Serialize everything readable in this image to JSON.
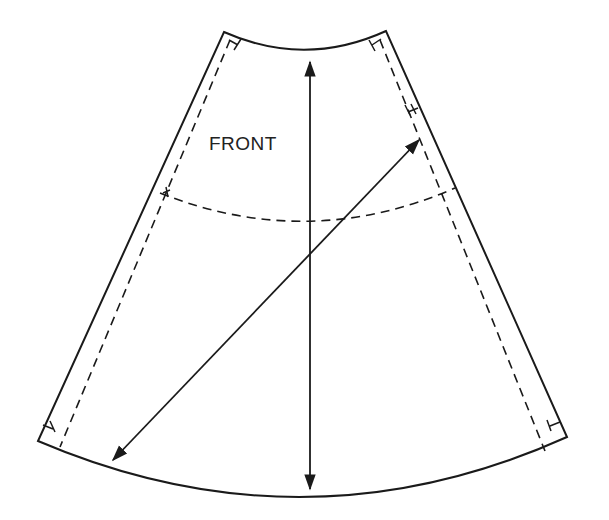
{
  "diagram": {
    "type": "sewing-pattern-piece",
    "piece_label": "FRONT",
    "line_color": "#1a1a1a",
    "background": "#ffffff",
    "elements": [
      {
        "name": "cutting-line",
        "style": "solid"
      },
      {
        "name": "seam-allowance-left",
        "style": "dashed"
      },
      {
        "name": "seam-allowance-right",
        "style": "dashed"
      },
      {
        "name": "hip-line",
        "style": "dashed"
      },
      {
        "name": "grainline-arrow",
        "style": "double-headed",
        "orientation": "vertical"
      },
      {
        "name": "bias-arrow",
        "style": "double-headed",
        "orientation": "diagonal"
      },
      {
        "name": "notches",
        "count": 6
      }
    ]
  }
}
